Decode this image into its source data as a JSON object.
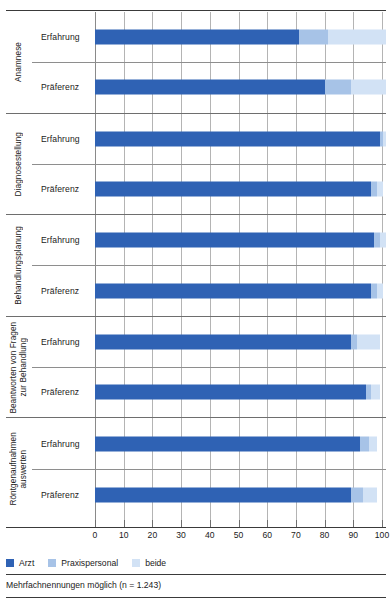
{
  "figure": {
    "cut_title_fragment": "",
    "footnote": "Mehrfachnennungen möglich (n = 1.243)"
  },
  "legend": {
    "items": [
      {
        "label": "Arzt",
        "color": "#2f62b4"
      },
      {
        "label": "Praxispersonal",
        "color": "#a7c3e7"
      },
      {
        "label": "beide",
        "color": "#d2e2f5"
      }
    ]
  },
  "axis": {
    "ticks": [
      0,
      10,
      20,
      30,
      40,
      50,
      60,
      70,
      80,
      90,
      100
    ],
    "tick_labels": [
      "0",
      "10",
      "20",
      "30",
      "40",
      "50",
      "60",
      "70",
      "80",
      "90",
      "100"
    ],
    "min": 0,
    "max": 100
  },
  "chart_data": {
    "type": "bar",
    "orientation": "horizontal",
    "stacked": true,
    "title": "",
    "subtitle": "",
    "xlabel": "",
    "ylabel": "",
    "xlim": [
      0,
      100
    ],
    "grid": true,
    "legend_position": "bottom-left",
    "note": "Mehrfachnennungen möglich (n = 1.243)",
    "series": [
      {
        "name": "Arzt",
        "color": "#2f62b4"
      },
      {
        "name": "Praxispersonal",
        "color": "#a7c3e7"
      },
      {
        "name": "beide",
        "color": "#d2e2f5"
      }
    ],
    "groups": [
      {
        "label": "Anamnese",
        "rows": [
          {
            "label": "Erfahrung",
            "values": [
              70,
              10,
              20
            ]
          },
          {
            "label": "Präferenz",
            "values": [
              79,
              9,
              12
            ]
          }
        ]
      },
      {
        "label": "Diagnosestellung",
        "rows": [
          {
            "label": "Erfahrung",
            "values": [
              98,
              1,
              1
            ]
          },
          {
            "label": "Präferenz",
            "values": [
              95,
              2,
              2
            ]
          }
        ]
      },
      {
        "label": "Behandlungsplanung",
        "rows": [
          {
            "label": "Erfahrung",
            "values": [
              96,
              2,
              2
            ]
          },
          {
            "label": "Präferenz",
            "values": [
              95,
              2,
              2
            ]
          }
        ]
      },
      {
        "label": "Beantworten von Fragen zur Behandlung",
        "rows": [
          {
            "label": "Erfahrung",
            "values": [
              88,
              2,
              8
            ]
          },
          {
            "label": "Präferenz",
            "values": [
              93,
              2,
              3
            ]
          }
        ]
      },
      {
        "label": "Röntgenaufnahmen auswerten",
        "rows": [
          {
            "label": "Erfahrung",
            "values": [
              91,
              3,
              3
            ]
          },
          {
            "label": "Präferenz",
            "values": [
              88,
              4,
              5
            ]
          }
        ]
      }
    ]
  }
}
